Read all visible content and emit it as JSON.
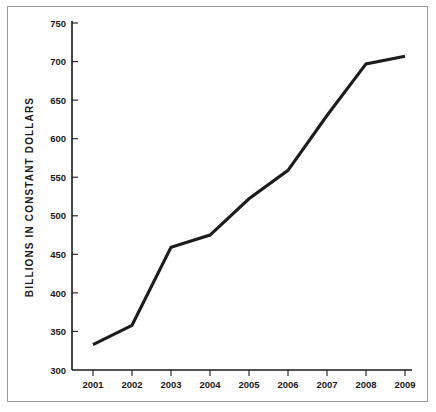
{
  "chart_data": {
    "type": "line",
    "title": "",
    "xlabel": "",
    "ylabel": "BILLIONS IN CONSTANT DOLLARS",
    "categories": [
      "2001",
      "2002",
      "2003",
      "2004",
      "2005",
      "2006",
      "2007",
      "2008",
      "2009"
    ],
    "values": [
      333,
      358,
      459,
      475,
      522,
      559,
      630,
      697,
      707
    ],
    "series": [
      {
        "name": "Billions in constant dollars",
        "values": [
          333,
          358,
          459,
          475,
          522,
          559,
          630,
          697,
          707
        ]
      }
    ],
    "ylim": [
      300,
      750
    ],
    "yticks": [
      300,
      350,
      400,
      450,
      500,
      550,
      600,
      650,
      700,
      750
    ],
    "ytick_labels": [
      "300",
      "350",
      "400",
      "450",
      "500",
      "550",
      "600",
      "650",
      "700",
      "750"
    ],
    "xtick_labels": [
      "2001",
      "2002",
      "2003",
      "2004",
      "2005",
      "2006",
      "2007",
      "2008",
      "2009"
    ],
    "grid": false,
    "legend": "none",
    "line_color": "#1c1c1c",
    "axis_color": "#1a1a1a",
    "background_color": "#ffffff",
    "border_color": "#9a9a9a"
  }
}
